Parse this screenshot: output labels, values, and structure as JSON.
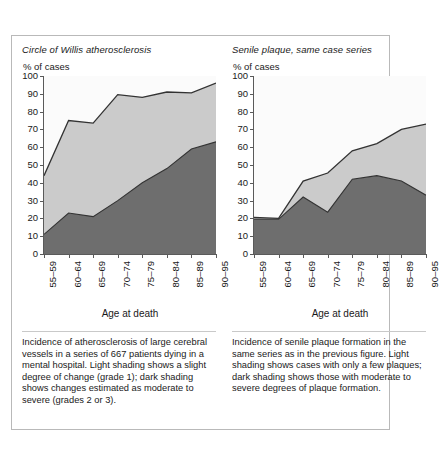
{
  "figure": {
    "panels": [
      {
        "title": "Circle of Willis atherosclerosis",
        "y_unit": "% of cases",
        "x_label": "Age at death",
        "caption": "Incidence of atherosclerosis of large cerebral vessels in a series of 667 patients dying in a mental hospital. Light shading shows a slight degree of change (grade 1); dark shading shows changes estimated as moderate to severe (grades 2 or 3)."
      },
      {
        "title": "Senile plaque, same case series",
        "y_unit": "% of cases",
        "x_label": "Age at death",
        "caption": "Incidence of senile plaque formation in the same series as in the previous figure. Light shading shows cases with only a few plaques; dark shading shows those with moderate to severe degrees of plaque formation."
      }
    ]
  },
  "colors": {
    "dark_shading": "#6e6e6e",
    "light_shading": "#cbcbcb",
    "plot_background": "#fbfbfb",
    "line": "#333333",
    "axis": "#5a5a5a",
    "border": "#b9b9b9"
  },
  "chart_data": [
    {
      "type": "area",
      "title": "Circle of Willis atherosclerosis",
      "xlabel": "Age at death",
      "ylabel": "% of cases",
      "ylim": [
        0,
        100
      ],
      "yticks": [
        0,
        10,
        20,
        30,
        40,
        50,
        60,
        70,
        80,
        90,
        100
      ],
      "grid": false,
      "legend": "none",
      "categories": [
        "55–59",
        "60–64",
        "65–69",
        "70–74",
        "75–79",
        "80–84",
        "85–89",
        "90–95"
      ],
      "series": [
        {
          "name": "Moderate to severe (grades 2 or 3) — dark shading",
          "values": [
            11,
            23,
            21,
            30,
            40,
            48,
            59,
            63
          ]
        },
        {
          "name": "Total affected (cumulative, incl. slight grade 1) — light shading upper bound",
          "values": [
            44,
            75,
            73.5,
            89.5,
            88,
            91,
            90.5,
            96
          ]
        }
      ]
    },
    {
      "type": "area",
      "title": "Senile plaque, same case series",
      "xlabel": "Age at death",
      "ylabel": "% of cases",
      "ylim": [
        0,
        100
      ],
      "yticks": [
        0,
        10,
        20,
        30,
        40,
        50,
        60,
        70,
        80,
        90,
        100
      ],
      "grid": false,
      "legend": "none",
      "categories": [
        "55–59",
        "60–64",
        "65–69",
        "70–74",
        "75–79",
        "80–84",
        "85–89",
        "90–95"
      ],
      "series": [
        {
          "name": "Moderate to severe plaque formation — dark shading",
          "values": [
            19.5,
            19.5,
            32,
            23.5,
            42,
            44,
            41,
            33
          ]
        },
        {
          "name": "Total affected (cumulative, incl. few plaques) — light shading upper bound",
          "values": [
            20.5,
            20,
            41,
            45.5,
            58,
            62,
            70,
            73
          ]
        }
      ]
    }
  ]
}
